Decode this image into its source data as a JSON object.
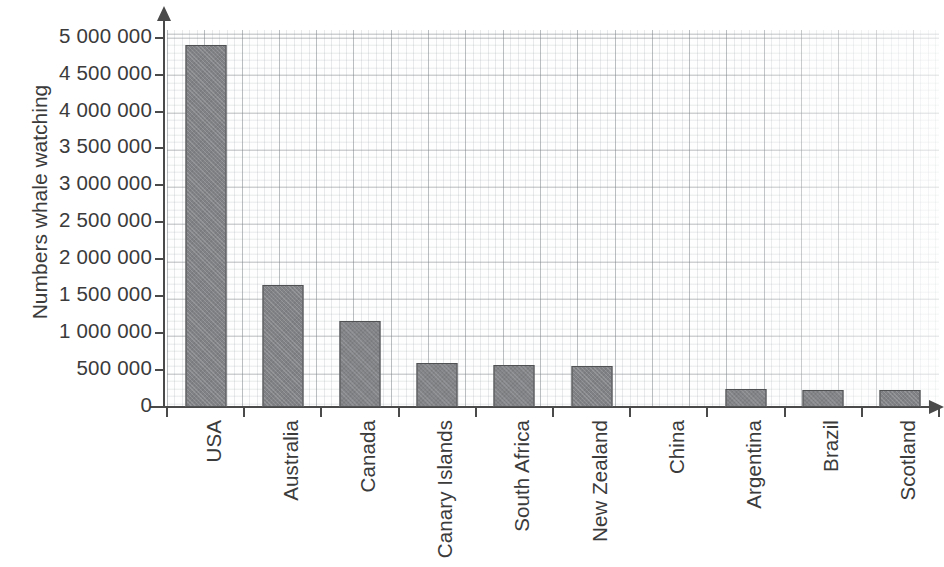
{
  "chart_data": {
    "type": "bar",
    "title": "",
    "xlabel": "",
    "ylabel": "Numbers whale watching",
    "categories": [
      "USA",
      "Australia",
      "Canada",
      "Canary Islands",
      "South Africa",
      "New Zealand",
      "China",
      "Argentina",
      "Brazil",
      "Scotland"
    ],
    "values": [
      4900000,
      1650000,
      1170000,
      600000,
      575000,
      550000,
      0,
      250000,
      235000,
      225000
    ],
    "ylim": [
      0,
      5000000
    ],
    "y_tick_values": [
      0,
      500000,
      1000000,
      1500000,
      2000000,
      2500000,
      3000000,
      3500000,
      4000000,
      4500000,
      5000000
    ],
    "y_tick_labels": [
      "0",
      "500 000",
      "1 000 000",
      "1 500 000",
      "2 000 000",
      "2 500 000",
      "3 000 000",
      "3 500 000",
      "4 000 000",
      "4 500 000",
      "5 000 000"
    ],
    "grid": true,
    "grid_style": "graph-paper",
    "legend": null,
    "bar_color": "#808285",
    "bar_border_color": "#4f5153",
    "axis_color": "#4a4a4a",
    "background_color": "#ffffff",
    "x_label_rotation": -90
  }
}
